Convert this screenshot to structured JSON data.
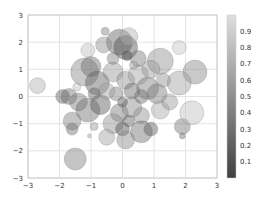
{
  "chart_data": {
    "type": "scatter",
    "title": "",
    "xlabel": "",
    "ylabel": "",
    "xlim": [
      -3,
      3
    ],
    "ylim": [
      -3,
      3
    ],
    "grid": true,
    "x_ticks": [
      "-3",
      "-2",
      "-1",
      "0",
      "1",
      "2",
      "3"
    ],
    "y_ticks": [
      "3",
      "2",
      "1",
      "0",
      "-1",
      "-2",
      "-3"
    ],
    "colormap": "gray",
    "alpha": 0.3,
    "colorbar": {
      "position": "right",
      "range": [
        0,
        1
      ],
      "ticks": [
        "0.9",
        "0.8",
        "0.7",
        "0.6",
        "0.5",
        "0.4",
        "0.3",
        "0.2",
        "0.1"
      ]
    },
    "points": [
      {
        "x": -2.7,
        "y": 0.4,
        "r": 8,
        "c": 0.7
      },
      {
        "x": -1.5,
        "y": -2.3,
        "r": 11,
        "c": 0.4
      },
      {
        "x": 1.9,
        "y": -1.1,
        "r": 8,
        "c": 0.35
      },
      {
        "x": 1.9,
        "y": -1.45,
        "r": 3,
        "c": 0.3
      },
      {
        "x": 2.2,
        "y": -0.6,
        "r": 12,
        "c": 0.8
      },
      {
        "x": 1.8,
        "y": 1.8,
        "r": 7,
        "c": 0.85
      },
      {
        "x": 1.2,
        "y": 1.3,
        "r": 13,
        "c": 0.5
      },
      {
        "x": 2.3,
        "y": 0.9,
        "r": 12,
        "c": 0.45
      },
      {
        "x": 1.8,
        "y": 0.5,
        "r": 12,
        "c": 0.6
      },
      {
        "x": -1.1,
        "y": 1.7,
        "r": 7,
        "c": 0.8
      },
      {
        "x": -0.55,
        "y": 2.4,
        "r": 4,
        "c": 0.4
      },
      {
        "x": -0.1,
        "y": 2.0,
        "r": 13,
        "c": 0.2
      },
      {
        "x": 0.1,
        "y": 1.8,
        "r": 12,
        "c": 0.1
      },
      {
        "x": 0.15,
        "y": 1.5,
        "r": 5,
        "c": 0.05
      },
      {
        "x": 0.2,
        "y": 2.2,
        "r": 9,
        "c": 0.7
      },
      {
        "x": -0.6,
        "y": 1.9,
        "r": 8,
        "c": 0.5
      },
      {
        "x": -1.2,
        "y": 0.9,
        "r": 14,
        "c": 0.45
      },
      {
        "x": -1.0,
        "y": 1.1,
        "r": 10,
        "c": 0.3
      },
      {
        "x": -0.8,
        "y": 0.5,
        "r": 12,
        "c": 0.2
      },
      {
        "x": -0.3,
        "y": 0.9,
        "r": 10,
        "c": 0.55
      },
      {
        "x": 0.1,
        "y": 0.6,
        "r": 9,
        "c": 0.5
      },
      {
        "x": 0.5,
        "y": 0.8,
        "r": 10,
        "c": 0.6
      },
      {
        "x": 0.8,
        "y": 0.3,
        "r": 11,
        "c": 0.4
      },
      {
        "x": 1.1,
        "y": 0.1,
        "r": 10,
        "c": 0.35
      },
      {
        "x": 1.3,
        "y": 0.6,
        "r": 7,
        "c": 0.5
      },
      {
        "x": 0.3,
        "y": 0.2,
        "r": 8,
        "c": 0.25
      },
      {
        "x": -0.2,
        "y": 0.1,
        "r": 7,
        "c": 0.4
      },
      {
        "x": -1.7,
        "y": 0.0,
        "r": 8,
        "c": 0.3
      },
      {
        "x": -1.9,
        "y": 0.0,
        "r": 7,
        "c": 0.2
      },
      {
        "x": -1.45,
        "y": 0.35,
        "r": 4,
        "c": 0.8
      },
      {
        "x": -1.4,
        "y": -0.2,
        "r": 9,
        "c": 0.35
      },
      {
        "x": -1.1,
        "y": -0.5,
        "r": 12,
        "c": 0.3
      },
      {
        "x": -0.7,
        "y": -0.3,
        "r": 10,
        "c": 0.15
      },
      {
        "x": -0.5,
        "y": 0.2,
        "r": 8,
        "c": 0.6
      },
      {
        "x": -0.1,
        "y": -0.6,
        "r": 9,
        "c": 0.35
      },
      {
        "x": 0.3,
        "y": -0.4,
        "r": 10,
        "c": 0.45
      },
      {
        "x": 0.6,
        "y": -0.7,
        "r": 8,
        "c": 0.5
      },
      {
        "x": 1.2,
        "y": -0.5,
        "r": 9,
        "c": 0.65
      },
      {
        "x": -1.6,
        "y": -0.9,
        "r": 9,
        "c": 0.4
      },
      {
        "x": -1.6,
        "y": -1.2,
        "r": 6,
        "c": 0.3
      },
      {
        "x": -0.9,
        "y": -1.1,
        "r": 4,
        "c": 0.55
      },
      {
        "x": -1.05,
        "y": -1.45,
        "r": 2,
        "c": 0.6
      },
      {
        "x": -0.3,
        "y": -1.0,
        "r": 10,
        "c": 0.5
      },
      {
        "x": 0.0,
        "y": -1.2,
        "r": 7,
        "c": 0.1
      },
      {
        "x": 0.2,
        "y": -0.9,
        "r": 6,
        "c": 0.2
      },
      {
        "x": 0.6,
        "y": -1.3,
        "r": 11,
        "c": 0.3
      },
      {
        "x": 0.9,
        "y": -1.2,
        "r": 7,
        "c": 0.2
      },
      {
        "x": 0.1,
        "y": -1.6,
        "r": 9,
        "c": 0.45
      },
      {
        "x": -0.5,
        "y": -1.5,
        "r": 8,
        "c": 0.6
      },
      {
        "x": 0.9,
        "y": 1.0,
        "r": 9,
        "c": 0.55
      },
      {
        "x": 0.5,
        "y": 1.4,
        "r": 8,
        "c": 0.35
      },
      {
        "x": -0.3,
        "y": 1.4,
        "r": 6,
        "c": 0.4
      },
      {
        "x": 0.35,
        "y": 1.15,
        "r": 4,
        "c": 0.6
      },
      {
        "x": 0.6,
        "y": 0.0,
        "r": 7,
        "c": 0.3
      },
      {
        "x": 1.5,
        "y": -0.2,
        "r": 8,
        "c": 0.55
      },
      {
        "x": -0.9,
        "y": 0.1,
        "r": 6,
        "c": 0.25
      },
      {
        "x": 0.0,
        "y": -0.2,
        "r": 5,
        "c": 0.15
      }
    ]
  }
}
